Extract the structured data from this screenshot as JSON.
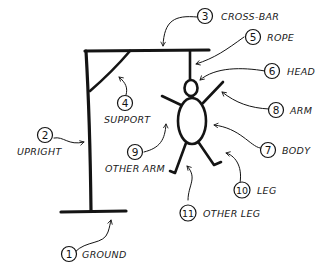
{
  "diagram": {
    "ink_color": "#141414",
    "background": "#ffffff",
    "parts": [
      {
        "number": "1",
        "label": "GROUND"
      },
      {
        "number": "2",
        "label": "UPRIGHT"
      },
      {
        "number": "3",
        "label": "CROSS-BAR"
      },
      {
        "number": "4",
        "label": "SUPPORT"
      },
      {
        "number": "5",
        "label": "ROPE"
      },
      {
        "number": "6",
        "label": "HEAD"
      },
      {
        "number": "7",
        "label": "BODY"
      },
      {
        "number": "8",
        "label": "ARM"
      },
      {
        "number": "9",
        "label": "OTHER ARM"
      },
      {
        "number": "10",
        "label": "LEG"
      },
      {
        "number": "11",
        "label": "OTHER LEG"
      }
    ]
  }
}
